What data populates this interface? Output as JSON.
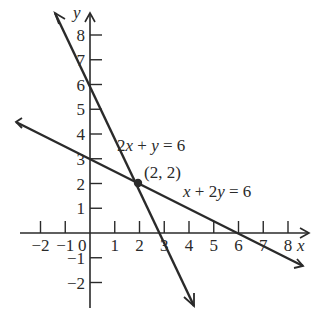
{
  "chart_data": {
    "type": "line",
    "title": "",
    "xlabel": "x",
    "ylabel": "y",
    "xlim": [
      -2.7,
      9
    ],
    "ylim": [
      -3,
      9
    ],
    "grid": false,
    "x_ticks": [
      "-2",
      "-1",
      "0",
      "1",
      "2",
      "3",
      "4",
      "5",
      "6",
      "7",
      "8"
    ],
    "y_ticks": [
      "-2",
      "-1",
      "1",
      "2",
      "3",
      "4",
      "5",
      "6",
      "7",
      "8"
    ],
    "series": [
      {
        "name": "2x + y = 6",
        "equation": "2x + y = 6",
        "points": [
          [
            -1.4,
            8.8
          ],
          [
            0,
            6
          ],
          [
            2,
            2
          ],
          [
            3,
            0
          ],
          [
            4.2,
            -2.4
          ]
        ]
      },
      {
        "name": "x + 2y = 6",
        "equation": "x + 2y = 6",
        "points": [
          [
            -3,
            4.5
          ],
          [
            0,
            3
          ],
          [
            2,
            2
          ],
          [
            6,
            0
          ],
          [
            8.6,
            -1.3
          ]
        ]
      }
    ],
    "annotations": [
      {
        "text": "(2, 2)",
        "x": 2,
        "y": 2,
        "type": "intersection-point"
      }
    ]
  },
  "labels": {
    "x_axis": "x",
    "y_axis": "y",
    "eq1": "2x + y = 6",
    "eq2": "x + 2y = 6",
    "point": "(2, 2)",
    "origin": "0"
  },
  "ticks": {
    "x": [
      {
        "v": -2,
        "t": "−2"
      },
      {
        "v": -1,
        "t": "−1"
      },
      {
        "v": 1,
        "t": "1"
      },
      {
        "v": 2,
        "t": "2"
      },
      {
        "v": 3,
        "t": "3"
      },
      {
        "v": 4,
        "t": "4"
      },
      {
        "v": 5,
        "t": "5"
      },
      {
        "v": 6,
        "t": "6"
      },
      {
        "v": 7,
        "t": "7"
      },
      {
        "v": 8,
        "t": "8"
      }
    ],
    "y": [
      {
        "v": -2,
        "t": "−2"
      },
      {
        "v": -1,
        "t": "−1"
      },
      {
        "v": 1,
        "t": "1"
      },
      {
        "v": 2,
        "t": "2"
      },
      {
        "v": 3,
        "t": "3"
      },
      {
        "v": 4,
        "t": "4"
      },
      {
        "v": 5,
        "t": "5"
      },
      {
        "v": 6,
        "t": "6"
      },
      {
        "v": 7,
        "t": "7"
      },
      {
        "v": 8,
        "t": "8"
      }
    ]
  },
  "colors": {
    "ink": "#2a2a2a",
    "background": "#ffffff"
  }
}
